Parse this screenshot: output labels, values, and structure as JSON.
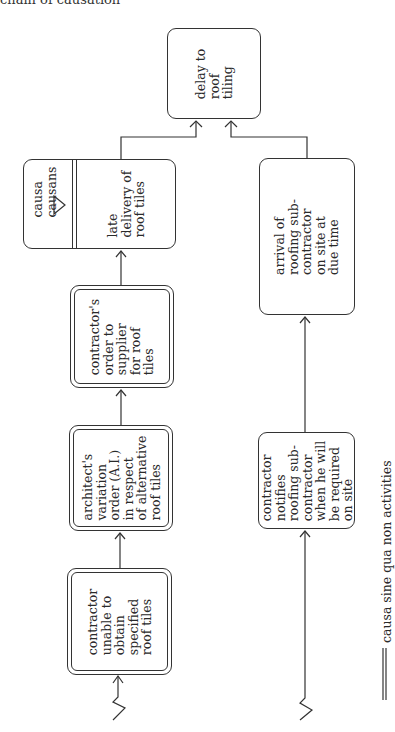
{
  "caption": "chain of causation",
  "nodes": {
    "delay": {
      "label": "delay to\nroof\ntiling",
      "type": "event"
    },
    "late_delivery": {
      "label": "late\ndelivery of\nroof tiles",
      "type": "causa_causans",
      "side_label": "causa\ncausans"
    },
    "contractors_order": {
      "label": "contractor's\norder to\nsupplier\nfor roof\ntiles",
      "type": "causa_sine_qua_non"
    },
    "architects_order": {
      "label": "architect's\nvariation\norder (A.I.)\nin respect\nof alternative\nroof tiles",
      "type": "causa_sine_qua_non"
    },
    "contractor_unable": {
      "label": "contractor\nunable to\nobtain\nspecified\nroof tiles",
      "type": "causa_sine_qua_non"
    },
    "arrival": {
      "label": "arrival of\nroofing sub-\ncontractor\non site at\ndue time",
      "type": "event"
    },
    "contractor_notifies": {
      "label": "contractor\nnotifies\nroofing sub-\ncontractor\nwhen he will\nbe required\non site",
      "type": "event"
    }
  },
  "edges": [
    {
      "from": "contractor_unable",
      "to": "architects_order"
    },
    {
      "from": "architects_order",
      "to": "contractors_order"
    },
    {
      "from": "contractors_order",
      "to": "late_delivery"
    },
    {
      "from": "late_delivery",
      "to": "delay"
    },
    {
      "from": "contractor_notifies",
      "to": "arrival"
    },
    {
      "from": "arrival",
      "to": "delay"
    }
  ],
  "legend": {
    "symbol": "double-line",
    "text": "causa sine qua non activities"
  },
  "colors": {
    "line": "#333333",
    "background": "#ffffff"
  }
}
